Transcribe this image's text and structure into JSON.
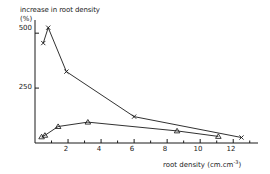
{
  "chart_data": {
    "type": "line",
    "title": "",
    "subtitle": "",
    "ylabel_line1": "increase in root density",
    "ylabel_line2": "(%)",
    "xlabel_text": "root density (cm.cm",
    "xlabel_sup": "-3",
    "xlabel_close": ")",
    "xlabel_full": "root density (cm.cm-3)",
    "ylabel_full": "increase in root density (%)",
    "xlim": [
      0,
      13.5
    ],
    "ylim": [
      0,
      560
    ],
    "grid": false,
    "legend": "none",
    "y_ticks": [
      250,
      500
    ],
    "y_tick_labels": [
      "250",
      "500"
    ],
    "y_minor_ticks": [],
    "x_ticks": [
      2,
      4,
      6,
      8,
      10,
      12
    ],
    "x_tick_labels": [
      "2",
      "4",
      "6",
      "8",
      "10",
      "12"
    ],
    "x_minor_ticks": [
      1,
      3,
      5,
      7,
      9,
      11,
      13
    ],
    "series": [
      {
        "name": "series-cross",
        "marker": "cross",
        "color": "#1a1a1a",
        "points": [
          {
            "x": 0.5,
            "y": 455
          },
          {
            "x": 0.8,
            "y": 525
          },
          {
            "x": 1.9,
            "y": 325
          },
          {
            "x": 6.0,
            "y": 120
          },
          {
            "x": 12.5,
            "y": 25
          }
        ]
      },
      {
        "name": "series-triangle",
        "marker": "triangle",
        "color": "#1a1a1a",
        "points": [
          {
            "x": 0.4,
            "y": 28
          },
          {
            "x": 0.6,
            "y": 35
          },
          {
            "x": 1.4,
            "y": 75
          },
          {
            "x": 3.2,
            "y": 95
          },
          {
            "x": 8.6,
            "y": 55
          },
          {
            "x": 11.1,
            "y": 30
          }
        ]
      }
    ]
  },
  "ticks": {
    "y": {
      "t500": "500",
      "t250": "250"
    },
    "x": {
      "t2": "2",
      "t4": "4",
      "t6": "6",
      "t8": "8",
      "t10": "10",
      "t12": "12"
    }
  }
}
